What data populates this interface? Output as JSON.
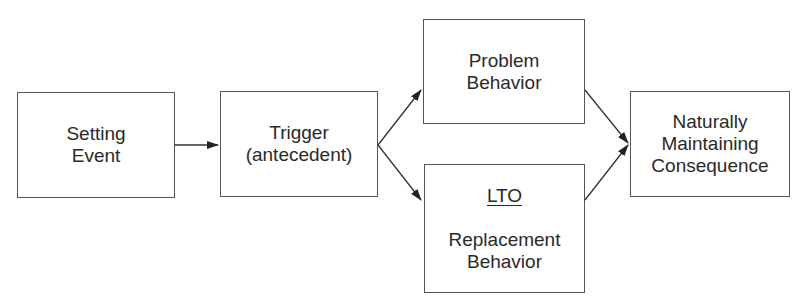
{
  "diagram": {
    "nodes": [
      {
        "id": "setting-event",
        "lines": [
          "Setting",
          "Event"
        ]
      },
      {
        "id": "trigger",
        "lines": [
          "Trigger",
          "(antecedent)"
        ]
      },
      {
        "id": "problem-behavior",
        "lines": [
          "Problem",
          "Behavior"
        ]
      },
      {
        "id": "replacement-behavior",
        "label_underlined": "LTO",
        "lines": [
          "Replacement",
          "Behavior"
        ]
      },
      {
        "id": "consequence",
        "lines": [
          "Naturally",
          "Maintaining",
          "Consequence"
        ]
      }
    ],
    "edges": [
      {
        "from": "setting-event",
        "to": "trigger"
      },
      {
        "from": "trigger",
        "to": "problem-behavior"
      },
      {
        "from": "trigger",
        "to": "replacement-behavior"
      },
      {
        "from": "problem-behavior",
        "to": "consequence"
      },
      {
        "from": "replacement-behavior",
        "to": "consequence"
      }
    ]
  }
}
